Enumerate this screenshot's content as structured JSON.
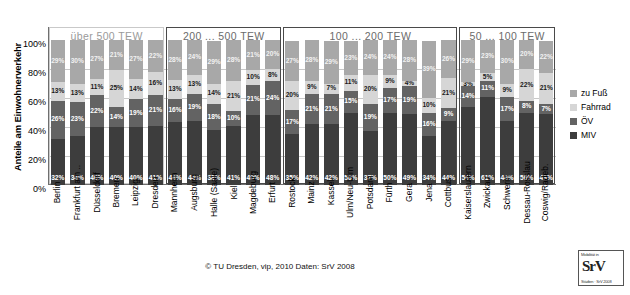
{
  "axis": {
    "y_title": "Anteile am Einwohnerverkehr",
    "yticks": [
      "100%",
      "80%",
      "60%",
      "40%",
      "20%",
      "0%"
    ]
  },
  "groups": [
    {
      "label": "über 500 TEW",
      "start": 0,
      "count": 6,
      "style": "light"
    },
    {
      "label": "200 ... 500 TEW",
      "start": 6,
      "count": 6,
      "style": "dark"
    },
    {
      "label": "100 ... 200 TEW",
      "start": 12,
      "count": 9,
      "style": "dark"
    },
    {
      "label": "50 ... 100 TEW",
      "start": 21,
      "count": 5,
      "style": "dark"
    }
  ],
  "legend": {
    "title": "",
    "items": [
      {
        "label": "zu Fuß",
        "key": "fuss",
        "color": "#a8a8a8"
      },
      {
        "label": "Fahrrad",
        "key": "fahrrad",
        "color": "#d6d6d6"
      },
      {
        "label": "ÖV",
        "key": "ov",
        "color": "#636363"
      },
      {
        "label": "MIV",
        "key": "miv",
        "color": "#3d3d3d"
      }
    ]
  },
  "footer": {
    "text": "© TU Dresden, vip, 2010    Daten: SrV 2008"
  },
  "logo": {
    "line1": "Mobilität in",
    "line2": "SrV",
    "line3": "Städten · SrV 2008"
  },
  "chart_data": {
    "type": "bar",
    "stacked": true,
    "title": "",
    "xlabel": "",
    "ylabel": "Anteile am Einwohnerverkehr",
    "ylim": [
      0,
      100
    ],
    "yticks": [
      0,
      20,
      40,
      60,
      80,
      100
    ],
    "grid": true,
    "legend_position": "right",
    "categories": [
      "Berlin",
      "Frankfurt am ..",
      "Düsseldorf",
      "Bremen",
      "Leipzig",
      "Dresden",
      "Mannheim",
      "Augsburg",
      "Halle (Saale)",
      "Kiel",
      "Magdeburg",
      "Erfurt",
      "Rostock",
      "Mainz",
      "Kassel",
      "Ulm/Neu-Ulm",
      "Potsdam",
      "Fürth",
      "Gera",
      "Jena",
      "Cottbus",
      "Kaiserslautern",
      "Zwickau",
      "Schwerin",
      "Dessau-Rosslau",
      "Coswig/Radeb."
    ],
    "series": [
      {
        "name": "MIV",
        "color": "#3d3d3d",
        "values": [
          32,
          34,
          40,
          40,
          40,
          41,
          44,
          44,
          38,
          41,
          49,
          48,
          35,
          42,
          42,
          50,
          37,
          50,
          49,
          34,
          44,
          54,
          61,
          44,
          50,
          49
        ]
      },
      {
        "name": "ÖV",
        "color": "#636363",
        "values": [
          26,
          23,
          22,
          14,
          19,
          21,
          16,
          19,
          18,
          10,
          21,
          24,
          17,
          21,
          21,
          15,
          19,
          17,
          19,
          16,
          9,
          14,
          11,
          17,
          8,
          7
        ]
      },
      {
        "name": "Fahrrad",
        "color": "#d6d6d6",
        "values": [
          13,
          13,
          11,
          25,
          14,
          16,
          13,
          13,
          14,
          21,
          10,
          8,
          20,
          9,
          7,
          11,
          20,
          9,
          4,
          10,
          21,
          3,
          5,
          9,
          22,
          21
        ]
      },
      {
        "name": "zu Fuß",
        "color": "#a8a8a8",
        "values": [
          29,
          30,
          27,
          21,
          27,
          22,
          28,
          24,
          29,
          28,
          21,
          20,
          27,
          28,
          29,
          23,
          24,
          24,
          28,
          39,
          26,
          29,
          23,
          30,
          20,
          22
        ]
      }
    ]
  }
}
